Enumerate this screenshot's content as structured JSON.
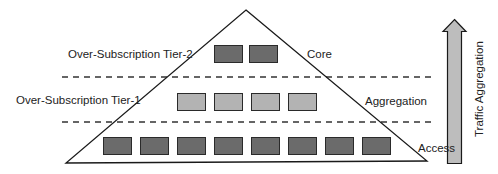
{
  "diagram": {
    "layers": [
      {
        "name": "Core",
        "switch_count": 2,
        "color": "#6b6b6b"
      },
      {
        "name": "Aggregation",
        "switch_count": 4,
        "color": "#b3b3b3"
      },
      {
        "name": "Access",
        "switch_count": 8,
        "color": "#6b6b6b"
      }
    ],
    "tiers": [
      {
        "label": "Over-Subscription Tier-2"
      },
      {
        "label": "Over-Subscription Tier-1"
      }
    ],
    "arrow": {
      "label": "Traffic Aggregation",
      "direction": "up",
      "fill": "#bdbdbd"
    },
    "colors": {
      "outline": "#1a1a1a",
      "dark_switch": "#6b6b6b",
      "light_switch": "#b3b3b3",
      "dash": "#333333"
    }
  }
}
